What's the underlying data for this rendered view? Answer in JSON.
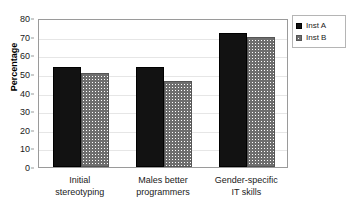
{
  "chart_data": {
    "type": "bar",
    "title": "",
    "xlabel": "",
    "ylabel": "Percentage",
    "ylim": [
      0,
      80
    ],
    "yticks": [
      0,
      10,
      20,
      30,
      40,
      50,
      60,
      70,
      80
    ],
    "ytick_labels": [
      "0",
      "10",
      "20",
      "30",
      "40",
      "50",
      "60",
      "70",
      "80"
    ],
    "grid": true,
    "grid_axis": "y",
    "legend_position": "top-right",
    "categories": [
      "Initial stereotyping",
      "Males better programmers",
      "Gender-specific IT skills"
    ],
    "category_lines": [
      [
        "Initial",
        "stereotyping"
      ],
      [
        "Males better",
        "programmers"
      ],
      [
        "Gender-specific",
        "IT skills"
      ]
    ],
    "series": [
      {
        "name": "Inst A",
        "values": [
          53.5,
          53.5,
          72
        ],
        "color": "#121212",
        "pattern": "solid"
      },
      {
        "name": "Inst B",
        "values": [
          50.5,
          46,
          70
        ],
        "color": "#6e6e6e",
        "pattern": "crosshatch"
      }
    ]
  },
  "legend": {
    "items": [
      {
        "label": "Inst A",
        "swatch": "solid-black-square"
      },
      {
        "label": "Inst B",
        "swatch": "crosshatch-square"
      }
    ]
  },
  "axes": {
    "y_title": "Percentage"
  }
}
